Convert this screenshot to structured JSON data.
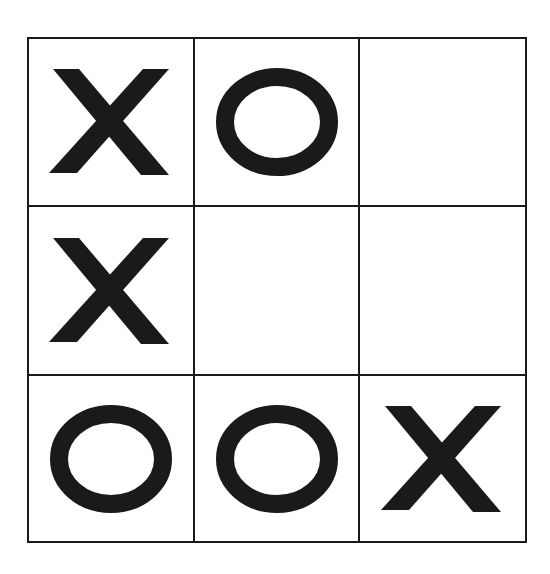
{
  "game": {
    "name": "Tic-Tac-Toe",
    "board": [
      [
        "X",
        "O",
        ""
      ],
      [
        "X",
        "",
        ""
      ],
      [
        "O",
        "O",
        "X"
      ]
    ]
  },
  "colors": {
    "ink": "#1a1a1a",
    "background": "#ffffff"
  }
}
